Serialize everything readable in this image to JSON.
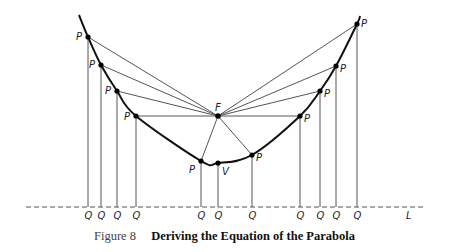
{
  "figure": {
    "number_label": "Figure 8",
    "title": "Deriving the Equation of the Parabola"
  },
  "labels": {
    "focus": "F",
    "vertex": "V",
    "point": "P",
    "foot": "Q",
    "directrix": "L"
  },
  "geometry": {
    "focus": [
      218,
      116
    ],
    "vertex": [
      218,
      163
    ],
    "directrix_y": 207,
    "directrix_x_range": [
      26,
      425
    ],
    "points": [
      {
        "p": [
          88,
          37
        ],
        "label_dx": -12,
        "label_dy": 3
      },
      {
        "p": [
          101,
          65
        ],
        "label_dx": -12,
        "label_dy": 3
      },
      {
        "p": [
          117,
          91
        ],
        "label_dx": -12,
        "label_dy": 3
      },
      {
        "p": [
          136,
          116
        ],
        "label_dx": -12,
        "label_dy": 4
      },
      {
        "p": [
          201,
          161
        ],
        "label_dx": -12,
        "label_dy": 12
      },
      {
        "p": [
          252,
          155
        ],
        "label_dx": 4,
        "label_dy": 6
      },
      {
        "p": [
          300,
          116
        ],
        "label_dx": 4,
        "label_dy": 6
      },
      {
        "p": [
          320,
          91
        ],
        "label_dx": 4,
        "label_dy": 6
      },
      {
        "p": [
          336,
          66
        ],
        "label_dx": 4,
        "label_dy": 6
      },
      {
        "p": [
          357,
          24
        ],
        "label_dx": 4,
        "label_dy": 3
      }
    ],
    "curve_ends": [
      [
        79,
        15
      ],
      [
        360,
        16
      ]
    ]
  },
  "colors": {
    "curve": "#111111",
    "lines": "#555555",
    "points": "#000000"
  }
}
